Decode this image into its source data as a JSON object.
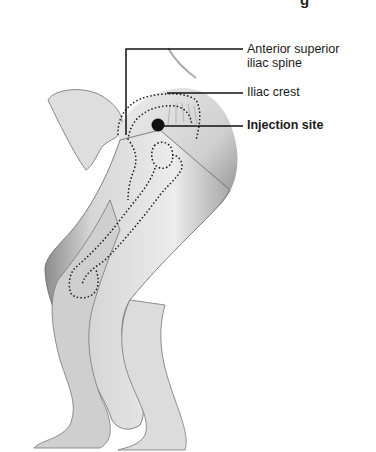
{
  "diagram": {
    "title_partial": "g",
    "labels": [
      {
        "id": "asis",
        "text_line1": "Anterior superior",
        "text_line2": "iliac spine",
        "bold": false
      },
      {
        "id": "iliac_crest",
        "text": "Iliac crest",
        "bold": false
      },
      {
        "id": "injection_site",
        "text": "Injection site",
        "bold": true
      }
    ],
    "colors": {
      "ink": "#1a1a1a",
      "skin": "#e6e6e6",
      "shade": "#9a9a9a",
      "background": "#ffffff"
    }
  }
}
